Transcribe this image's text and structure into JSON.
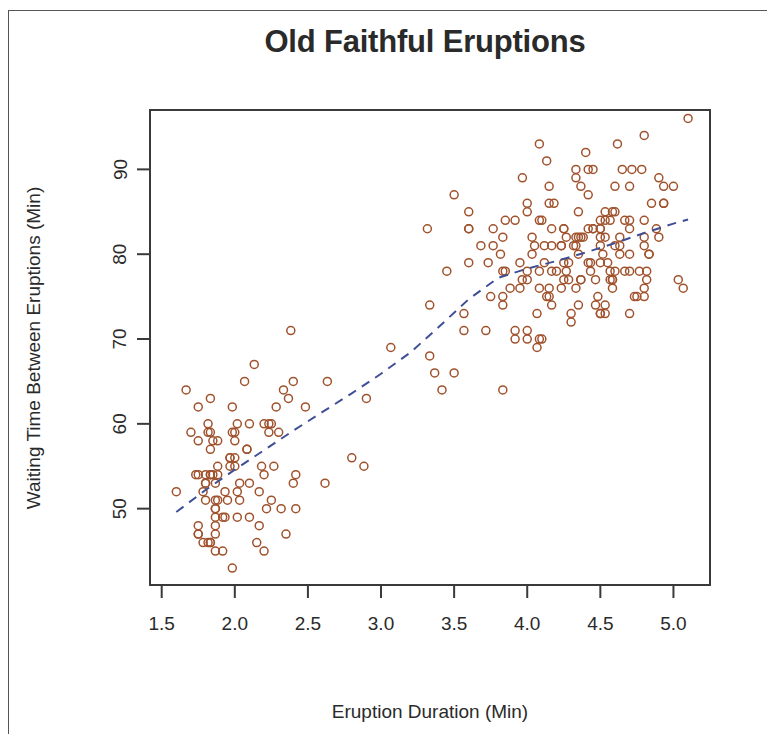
{
  "chart_data": {
    "type": "scatter",
    "title": "Old Faithful Eruptions",
    "xlabel": "Eruption Duration (Min)",
    "ylabel": "Waiting Time Between Eruptions (Min)",
    "xlim": [
      1.42,
      5.25
    ],
    "ylim": [
      41,
      97
    ],
    "grid": false,
    "legend": null,
    "point_style": {
      "marker": "open-circle",
      "color": "#a0522d",
      "radius": 4.0,
      "stroke_width": 1.5
    },
    "xticks": [
      1.5,
      2.0,
      2.5,
      3.0,
      3.5,
      4.0,
      4.5,
      5.0
    ],
    "xtick_labels": [
      "1.5",
      "2.0",
      "2.5",
      "3.0",
      "3.5",
      "4.0",
      "4.5",
      "5.0"
    ],
    "yticks": [
      50,
      60,
      70,
      80,
      90
    ],
    "ytick_labels": [
      "50",
      "60",
      "70",
      "80",
      "90"
    ],
    "series": [
      {
        "name": "eruptions",
        "x": [
          3.6,
          1.8,
          3.333,
          2.283,
          4.533,
          2.883,
          4.7,
          3.6,
          1.95,
          4.35,
          1.833,
          3.917,
          4.2,
          1.75,
          4.7,
          2.167,
          1.75,
          4.8,
          1.6,
          4.25,
          1.8,
          1.75,
          3.45,
          3.067,
          4.533,
          3.6,
          1.967,
          4.083,
          3.85,
          4.433,
          4.3,
          4.467,
          3.367,
          4.033,
          3.833,
          2.017,
          1.867,
          4.833,
          1.833,
          4.783,
          4.35,
          1.883,
          4.567,
          1.75,
          4.533,
          3.317,
          3.833,
          2.1,
          4.633,
          2.0,
          4.8,
          4.716,
          1.833,
          4.833,
          1.733,
          4.883,
          3.717,
          1.667,
          4.567,
          4.317,
          2.233,
          4.5,
          1.75,
          4.8,
          1.817,
          4.4,
          4.167,
          4.7,
          2.067,
          4.7,
          4.033,
          1.967,
          4.5,
          4.0,
          1.983,
          5.067,
          2.017,
          4.567,
          3.883,
          3.6,
          4.133,
          4.333,
          4.1,
          2.633,
          4.067,
          4.933,
          3.95,
          4.517,
          2.167,
          4.0,
          2.2,
          4.333,
          1.867,
          4.817,
          1.833,
          4.3,
          4.667,
          3.75,
          1.867,
          4.9,
          2.483,
          4.367,
          2.1,
          4.5,
          4.05,
          1.867,
          4.7,
          1.783,
          4.85,
          3.683,
          4.733,
          2.3,
          4.9,
          4.417,
          1.7,
          4.633,
          2.317,
          4.6,
          1.817,
          4.417,
          2.617,
          4.067,
          4.25,
          1.967,
          4.6,
          3.767,
          1.917,
          4.5,
          2.267,
          4.65,
          1.867,
          4.167,
          2.8,
          4.333,
          1.833,
          4.383,
          1.883,
          4.933,
          2.033,
          3.733,
          4.233,
          2.233,
          4.533,
          4.817,
          4.333,
          1.983,
          4.633,
          2.017,
          5.1,
          1.8,
          5.033,
          4.0,
          2.4,
          4.6,
          3.567,
          4.0,
          4.5,
          4.083,
          1.8,
          3.967,
          2.2,
          4.15,
          2.0,
          3.833,
          3.5,
          4.583,
          2.367,
          5.0,
          1.933,
          4.617,
          1.917,
          2.083,
          4.583,
          3.333,
          4.167,
          4.333,
          4.5,
          2.417,
          4.0,
          4.167,
          1.883,
          4.583,
          4.25,
          3.767,
          2.033,
          4.433,
          4.083,
          1.833,
          4.417,
          2.183,
          4.8,
          1.833,
          4.8,
          4.1,
          3.966,
          4.233,
          3.5,
          4.366,
          2.25,
          4.667,
          2.1,
          4.35,
          4.133,
          1.867,
          4.6,
          1.783,
          4.367,
          3.85,
          1.933,
          4.5,
          2.383,
          4.7,
          1.867,
          3.833,
          3.417,
          4.233,
          2.4,
          4.8,
          2.0,
          4.15,
          1.867,
          4.267,
          1.75,
          4.483,
          4.0,
          4.117,
          4.083,
          4.267,
          3.917,
          4.55,
          4.083,
          2.417,
          4.183,
          2.217,
          4.45,
          1.883,
          1.85,
          4.283,
          3.95,
          2.333,
          4.15,
          2.35,
          4.933,
          2.9,
          4.583,
          3.833,
          2.083,
          4.367,
          2.133,
          4.35,
          2.2,
          4.45,
          3.567,
          4.5,
          4.15,
          3.817,
          3.917,
          4.45,
          2.0,
          4.283,
          4.767,
          4.533,
          1.85,
          4.25,
          1.983,
          2.25,
          4.75,
          4.117,
          2.15,
          4.417,
          1.817,
          4.467
        ],
        "y": [
          79,
          54,
          74,
          62,
          85,
          55,
          88,
          85,
          51,
          85,
          54,
          84,
          78,
          47,
          83,
          52,
          62,
          84,
          52,
          79,
          51,
          47,
          78,
          69,
          74,
          83,
          55,
          76,
          78,
          79,
          73,
          77,
          66,
          80,
          74,
          52,
          48,
          80,
          59,
          90,
          80,
          58,
          84,
          58,
          73,
          83,
          64,
          53,
          82,
          59,
          75,
          90,
          54,
          80,
          54,
          83,
          71,
          64,
          77,
          81,
          59,
          84,
          48,
          82,
          60,
          92,
          78,
          78,
          65,
          73,
          82,
          56,
          79,
          71,
          62,
          76,
          60,
          78,
          76,
          83,
          75,
          82,
          70,
          65,
          73,
          88,
          76,
          80,
          48,
          86,
          60,
          90,
          50,
          78,
          63,
          72,
          84,
          75,
          51,
          82,
          62,
          88,
          49,
          83,
          81,
          47,
          84,
          52,
          86,
          81,
          75,
          59,
          89,
          79,
          59,
          81,
          50,
          85,
          59,
          87,
          53,
          69,
          77,
          56,
          88,
          81,
          45,
          82,
          55,
          90,
          45,
          83,
          56,
          89,
          46,
          82,
          51,
          86,
          53,
          79,
          81,
          60,
          82,
          77,
          76,
          59,
          80,
          49,
          96,
          53,
          77,
          77,
          65,
          81,
          71,
          70,
          81,
          93,
          53,
          89,
          45,
          86,
          58,
          78,
          66,
          76,
          63,
          88,
          52,
          93,
          49,
          57,
          77,
          68,
          81,
          81,
          73,
          50,
          85,
          74,
          55,
          77,
          83,
          83,
          51,
          78,
          84,
          46,
          83,
          55,
          81,
          57,
          76,
          84,
          77,
          81,
          87,
          77,
          51,
          78,
          60,
          82,
          91,
          53,
          78,
          46,
          77,
          84,
          49,
          83,
          71,
          80,
          49,
          75,
          64,
          76,
          53,
          94,
          55,
          76,
          50,
          82,
          54,
          75,
          78,
          79,
          78,
          78,
          70,
          79,
          70,
          54,
          86,
          50,
          90,
          54,
          54,
          77,
          79,
          64,
          75,
          47,
          86,
          63,
          85,
          82,
          57,
          82,
          67,
          74,
          54,
          83,
          73,
          73,
          88,
          80,
          71,
          83,
          56,
          79,
          78,
          84,
          58,
          83,
          43,
          60,
          75,
          81,
          46,
          90,
          46,
          74
        ]
      }
    ],
    "trend_line": {
      "name": "loess-smoother",
      "style": "dashed",
      "color": "#3f4f96",
      "width": 2.0,
      "x": [
        1.6,
        1.8,
        2.0,
        2.2,
        2.4,
        2.6,
        2.8,
        3.0,
        3.2,
        3.4,
        3.6,
        3.8,
        4.0,
        4.2,
        4.4,
        4.6,
        4.8,
        5.0,
        5.1
      ],
      "y": [
        49.6,
        52.2,
        54.6,
        56.9,
        59.2,
        61.4,
        63.6,
        65.9,
        68.4,
        71.5,
        74.7,
        77.2,
        78.3,
        79.2,
        80.2,
        81.3,
        82.5,
        83.6,
        84.1
      ]
    }
  }
}
